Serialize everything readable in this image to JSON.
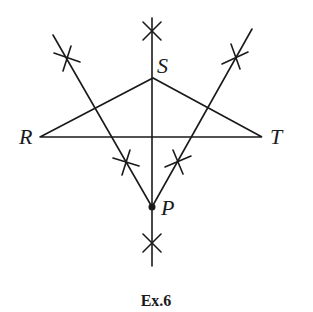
{
  "figure": {
    "caption": "Ex.6",
    "points": {
      "S": {
        "label": "S",
        "x": 153,
        "y": 78
      },
      "R": {
        "label": "R",
        "x": 40,
        "y": 137
      },
      "T": {
        "label": "T",
        "x": 262,
        "y": 137
      },
      "P": {
        "label": "P",
        "x": 152,
        "y": 207
      }
    },
    "stroke_color": "#1a1a1a",
    "background": "#ffffff"
  }
}
